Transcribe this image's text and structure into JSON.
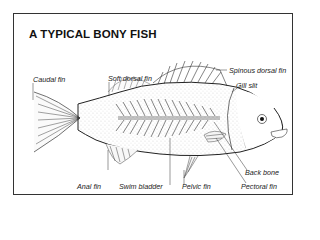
{
  "title": "A TYPICAL BONY FISH",
  "labels": {
    "caudal_fin": "Caudal fin",
    "soft_dorsal_fin": "Soft dorsal fin",
    "spinous_dorsal_fin": "Spinous dorsal fin",
    "gill_slit": "Gill slit",
    "back_bone": "Back bone",
    "anal_fin": "Anal fin",
    "swim_bladder": "Swim bladder",
    "pelvic_fin": "Pelvic fin",
    "pectoral_fin": "Pectoral fin"
  },
  "colors": {
    "ink": "#222222",
    "background": "#ffffff"
  }
}
